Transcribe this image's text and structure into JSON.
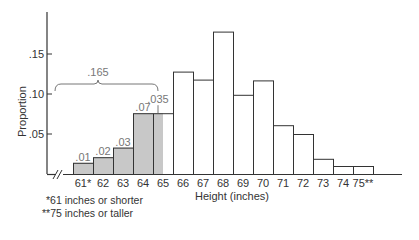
{
  "chart_data": {
    "type": "bar",
    "title": "",
    "xlabel": "Height (inches)",
    "ylabel": "Proportion",
    "ylim": [
      0,
      0.2
    ],
    "yticks": [
      0.05,
      0.1,
      0.15
    ],
    "ytick_labels": [
      ".05",
      ".10",
      ".15"
    ],
    "categories": [
      "61*",
      "62",
      "63",
      "64",
      "65",
      "66",
      "67",
      "68",
      "69",
      "70",
      "71",
      "72",
      "73",
      "74",
      "75**"
    ],
    "values": [
      0.014,
      0.021,
      0.033,
      0.076,
      0.076,
      0.128,
      0.118,
      0.178,
      0.099,
      0.117,
      0.061,
      0.05,
      0.019,
      0.01,
      0.01
    ],
    "shaded": [
      "full",
      "full",
      "full",
      "full",
      "left-half",
      "none",
      "none",
      "none",
      "none",
      "none",
      "none",
      "none",
      "none",
      "none",
      "none"
    ],
    "bar_annotations": [
      {
        "category": "61*",
        "label": ".01"
      },
      {
        "category": "62",
        "label": ".02"
      },
      {
        "category": "63",
        "label": ".03"
      },
      {
        "category": "64",
        "label": ".07"
      },
      {
        "category": "65",
        "label": ".035"
      }
    ],
    "brace": {
      "label": ".165",
      "from": "61*",
      "to": "65 (half)"
    },
    "grid": false,
    "axis_break": "//"
  },
  "footnotes": {
    "line1": "*61 inches or shorter",
    "line2": "**75 inches or taller"
  },
  "colors": {
    "shade": "#c8c8c8",
    "line": "#333333",
    "annotation": "#777777"
  }
}
